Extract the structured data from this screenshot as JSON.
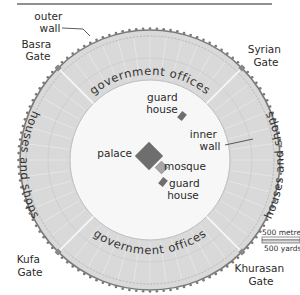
{
  "title_fragment": "Baghdad, the Round City",
  "labels": {
    "outer_wall": [
      "outer",
      "wall"
    ],
    "inner_wall": [
      "inner",
      "wall"
    ],
    "palace": "palace",
    "mosque": "mosque",
    "guard_house_north": [
      "guard",
      "house"
    ],
    "guard_house_south": [
      "guard",
      "house"
    ]
  },
  "ring_labels": {
    "top": "government offices",
    "bottom": "government offices",
    "left": "houses and shops",
    "right": "houses and shops"
  },
  "gates": {
    "nw": [
      "Basra",
      "Gate"
    ],
    "ne": [
      "Syrian",
      "Gate"
    ],
    "sw": [
      "Kufa",
      "Gate"
    ],
    "se": [
      "Khurasan",
      "Gate"
    ]
  },
  "scale": {
    "metric": "500 metres",
    "imperial": "500 yards"
  },
  "colors": {
    "ring_fill": "#d9d9d9",
    "ring_edge": "#bdbdbd",
    "inner_fill": "#f7f7f7",
    "wall": "#7a7a7a",
    "palace": "#6e6e6e",
    "mosque": "#a6a6a6",
    "guard": "#6e6e6e"
  }
}
